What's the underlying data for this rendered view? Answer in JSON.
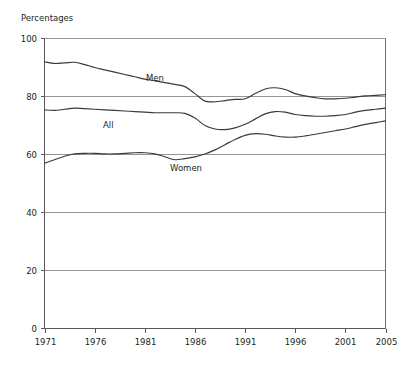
{
  "chart_data": {
    "type": "line",
    "title": "",
    "ylabel": "Percentages",
    "xlabel": "",
    "ylim": [
      0,
      100
    ],
    "xlim": [
      1971,
      2005
    ],
    "yticks": [
      0,
      20,
      40,
      60,
      80,
      100
    ],
    "xticks": [
      1971,
      1976,
      1981,
      1986,
      1991,
      1996,
      2001,
      2005
    ],
    "grid": "horizontal",
    "legend": "inline-labels",
    "x": [
      1971,
      1972,
      1973,
      1974,
      1975,
      1976,
      1977,
      1978,
      1979,
      1980,
      1981,
      1982,
      1983,
      1984,
      1985,
      1986,
      1987,
      1988,
      1989,
      1990,
      1991,
      1992,
      1993,
      1994,
      1995,
      1996,
      1997,
      1998,
      1999,
      2000,
      2001,
      2002,
      2003,
      2004,
      2005
    ],
    "series": [
      {
        "name": "Men",
        "label": "Men",
        "color": "#3a3a3c",
        "values": [
          92.0,
          91.4,
          91.6,
          91.8,
          91.0,
          90.0,
          89.2,
          88.4,
          87.6,
          86.8,
          86.0,
          85.4,
          84.8,
          84.2,
          83.4,
          81.0,
          78.4,
          78.2,
          78.6,
          79.0,
          79.2,
          81.0,
          82.6,
          83.0,
          82.4,
          81.0,
          80.2,
          79.6,
          79.2,
          79.2,
          79.4,
          79.8,
          80.2,
          80.4,
          80.6
        ]
      },
      {
        "name": "All",
        "label": "All",
        "color": "#3a3a3c",
        "values": [
          75.4,
          75.2,
          75.6,
          76.0,
          75.8,
          75.6,
          75.4,
          75.2,
          75.0,
          74.8,
          74.6,
          74.4,
          74.4,
          74.4,
          74.2,
          72.6,
          70.0,
          68.8,
          68.6,
          69.2,
          70.4,
          72.2,
          74.0,
          74.8,
          74.6,
          73.8,
          73.4,
          73.2,
          73.2,
          73.4,
          73.8,
          74.6,
          75.2,
          75.6,
          76.0
        ]
      },
      {
        "name": "Women",
        "label": "Women",
        "color": "#3a3a3c",
        "values": [
          57.0,
          58.2,
          59.4,
          60.2,
          60.4,
          60.4,
          60.2,
          60.2,
          60.4,
          60.6,
          60.6,
          60.2,
          59.2,
          58.2,
          58.6,
          59.2,
          60.2,
          61.6,
          63.4,
          65.2,
          66.6,
          67.2,
          67.0,
          66.4,
          66.0,
          66.0,
          66.4,
          67.0,
          67.6,
          68.2,
          68.8,
          69.6,
          70.4,
          71.0,
          71.6
        ]
      }
    ],
    "series_label_positions": [
      {
        "name": "Men",
        "x": 146,
        "y": 81
      },
      {
        "name": "All",
        "x": 103,
        "y": 128
      },
      {
        "name": "Women",
        "x": 170,
        "y": 171
      }
    ]
  }
}
